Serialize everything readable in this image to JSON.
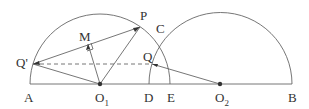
{
  "labels": {
    "A": "A",
    "O1": "O",
    "O1_sub": "1",
    "D": "D",
    "E": "E",
    "O2": "O",
    "O2_sub": "2",
    "B": "B",
    "P": "P",
    "C": "C",
    "M": "M",
    "Q": "Q",
    "Q_prime": "Q'"
  },
  "colors": {
    "stroke": "#555555",
    "text": "#333333"
  }
}
